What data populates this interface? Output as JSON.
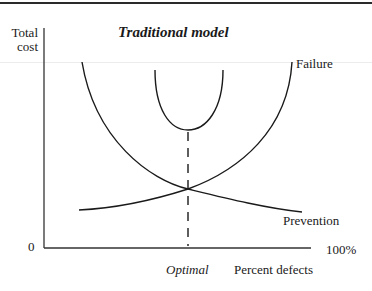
{
  "diagram": {
    "title": "Traditional model",
    "y_axis": {
      "label_line1": "Total",
      "label_line2": "cost",
      "origin_label": "0"
    },
    "x_axis": {
      "end_label": "100%",
      "label": "Percent defects",
      "marker_label": "Optimal"
    },
    "curves": [
      {
        "name": "Failure",
        "label": "Failure",
        "trend": "increasing with percent defects"
      },
      {
        "name": "Prevention",
        "label": "Prevention",
        "trend": "decreasing with percent defects"
      },
      {
        "name": "Total cost",
        "label": "",
        "trend": "U-shaped, minimum at optimal"
      }
    ],
    "colors": {
      "ink": "#1a1a1a",
      "background": "#ffffff"
    }
  }
}
